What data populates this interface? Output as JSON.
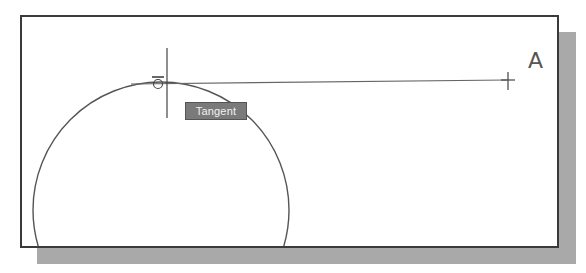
{
  "diagram": {
    "tooltip": {
      "label": "Tangent"
    },
    "point_label": "A",
    "colors": {
      "frame_border": "#3a3a3a",
      "shadow": "#a9a9a9",
      "line": "#555555",
      "tooltip_bg": "#7a7a7a",
      "tooltip_text": "#f2f2f2"
    }
  }
}
